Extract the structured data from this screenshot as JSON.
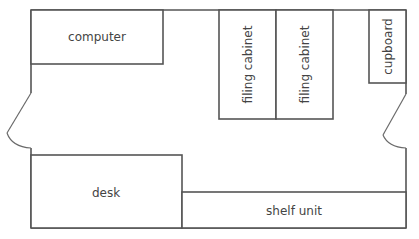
{
  "diagram": {
    "type": "floor-plan",
    "room": {
      "bounds": {
        "left": 31,
        "top": 10,
        "right": 406,
        "bottom": 228
      },
      "wall_color": "#555555"
    },
    "doors": [
      {
        "name": "left-door",
        "wall": "left",
        "gap_top": 93,
        "gap_bottom": 148,
        "swing_to": [
          7,
          133
        ]
      },
      {
        "name": "right-door",
        "wall": "right",
        "gap_top": 94,
        "gap_bottom": 148,
        "swing_to": [
          383,
          135
        ]
      }
    ],
    "furniture": [
      {
        "id": "computer",
        "label": "computer",
        "x": 31,
        "y": 10,
        "w": 132,
        "h": 54,
        "orientation": "horizontal"
      },
      {
        "id": "filing_cabinet_1",
        "label": "filing cabinet",
        "x": 219,
        "y": 10,
        "w": 57,
        "h": 109,
        "orientation": "vertical"
      },
      {
        "id": "filing_cabinet_2",
        "label": "filing cabinet",
        "x": 276,
        "y": 10,
        "w": 57,
        "h": 109,
        "orientation": "vertical"
      },
      {
        "id": "cupboard",
        "label": "cupboard",
        "x": 369,
        "y": 10,
        "w": 37,
        "h": 73,
        "orientation": "vertical"
      },
      {
        "id": "desk",
        "label": "desk",
        "x": 31,
        "y": 155,
        "w": 151,
        "h": 73,
        "orientation": "horizontal"
      },
      {
        "id": "shelf_unit",
        "label": "shelf unit",
        "x": 182,
        "y": 192,
        "w": 224,
        "h": 36,
        "orientation": "horizontal"
      }
    ]
  },
  "labels": {
    "computer": "computer",
    "filing_cabinet_1": "filing cabinet",
    "filing_cabinet_2": "filing cabinet",
    "cupboard": "cupboard",
    "desk": "desk",
    "shelf_unit": "shelf unit"
  }
}
